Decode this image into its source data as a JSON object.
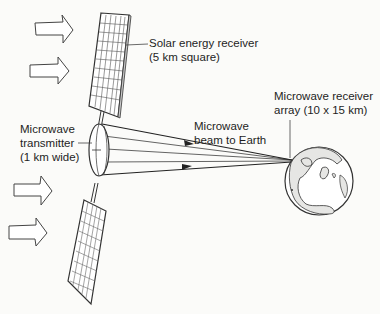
{
  "diagram": {
    "labels": {
      "solar_receiver": {
        "line1": "Solar energy receiver",
        "line2": "(5 km square)"
      },
      "transmitter": {
        "line1": "Microwave",
        "line2": "transmitter",
        "line3": "(1 km wide)"
      },
      "beam": {
        "line1": "Microwave",
        "line2": "beam to Earth"
      },
      "receiver_array": {
        "line1": "Microwave receiver",
        "line2": "array (10 x 15 km)"
      }
    },
    "components": [
      "sunlight-arrows",
      "upper-solar-panel",
      "lower-solar-panel",
      "microwave-transmitter",
      "microwave-beam",
      "earth-globe"
    ],
    "colors": {
      "line": "#2a2a2a",
      "land": "#e6e6e4",
      "background": "#fbfbf9"
    }
  }
}
